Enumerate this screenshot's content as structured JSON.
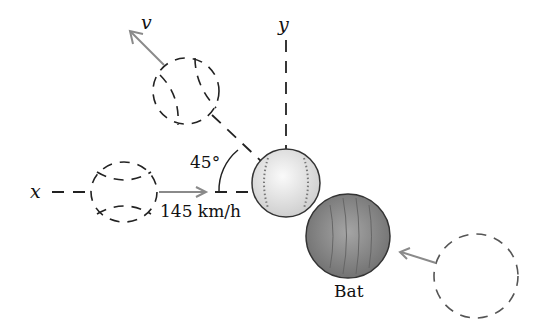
{
  "labels": {
    "x_axis": "x",
    "y_axis": "y",
    "velocity": "v",
    "angle": "45°",
    "speed": "145 km/h",
    "bat": "Bat"
  },
  "colors": {
    "line": "#222222",
    "arrow": "#8a8a8a",
    "ball_fill": "#e8e8e8",
    "bat_fill": "#8c8c8c"
  }
}
